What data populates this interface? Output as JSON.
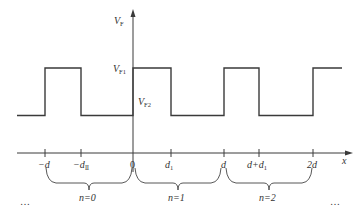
{
  "diagram": {
    "type": "periodic square wave",
    "colors": {
      "line": "#3a3a3a",
      "text": "#333333",
      "background": "#ffffff"
    },
    "y_axis": {
      "label": "V",
      "label_sub": "F"
    },
    "x_axis": {
      "label": "x"
    },
    "levels": {
      "high": {
        "label": "V",
        "sub": "F1"
      },
      "low": {
        "label": "V",
        "sub": "F2"
      }
    },
    "ticks": [
      {
        "label": "−d",
        "sub": ""
      },
      {
        "label": "−d",
        "sub": "Ⅱ"
      },
      {
        "label": "0",
        "sub": ""
      },
      {
        "label": "d",
        "sub": "1"
      },
      {
        "label": "d",
        "sub": ""
      },
      {
        "label": "d+d",
        "sub": "1"
      },
      {
        "label": "2d",
        "sub": ""
      }
    ],
    "periods": [
      {
        "label": "n=0"
      },
      {
        "label": "n=1"
      },
      {
        "label": "n=2"
      }
    ],
    "ellipsis_left": "…",
    "ellipsis_right": "…"
  }
}
